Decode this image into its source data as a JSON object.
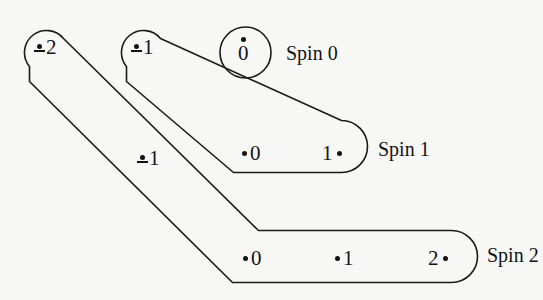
{
  "figure": {
    "background_color": "#f7f7f6",
    "stroke_color": "#1a1a1a",
    "text_color": "#131313"
  },
  "multiplets": [
    {
      "id": "spin-0",
      "caption": "Spin 0",
      "shape": "circle",
      "states": [
        {
          "id": "spin0-state-0",
          "label": "0",
          "marker": "dot-above",
          "sign": ""
        }
      ]
    },
    {
      "id": "spin-1",
      "caption": "Spin 1",
      "shape": "bent-tube",
      "states": [
        {
          "id": "spin1-state-neg1",
          "label": "1",
          "marker": "dot-above-minus",
          "sign": "-"
        },
        {
          "id": "spin1-state-0",
          "label": "0",
          "marker": "dot-left",
          "sign": ""
        },
        {
          "id": "spin1-state-1",
          "label": "1",
          "marker": "dot-right",
          "sign": ""
        }
      ]
    },
    {
      "id": "spin-2",
      "caption": "Spin 2",
      "shape": "bent-tube",
      "states": [
        {
          "id": "spin2-state-neg2",
          "label": "2",
          "marker": "dot-above-minus",
          "sign": "-"
        },
        {
          "id": "spin2-state-neg1",
          "label": "1",
          "marker": "dot-above-minus",
          "sign": "-"
        },
        {
          "id": "spin2-state-0",
          "label": "0",
          "marker": "dot-left",
          "sign": ""
        },
        {
          "id": "spin2-state-1",
          "label": "1",
          "marker": "dot-left",
          "sign": ""
        },
        {
          "id": "spin2-state-2",
          "label": "2",
          "marker": "dot-right",
          "sign": ""
        }
      ]
    }
  ],
  "captions": {
    "spin0": "Spin 0",
    "spin1": "Spin 1",
    "spin2": "Spin 2"
  },
  "labels": {
    "spin0_zero": "0",
    "spin1_neg1": "1",
    "spin1_zero": "0",
    "spin1_one": "1",
    "spin2_neg2": "2",
    "spin2_neg1": "1",
    "spin2_zero": "0",
    "spin2_one": "1",
    "spin2_two": "2"
  }
}
